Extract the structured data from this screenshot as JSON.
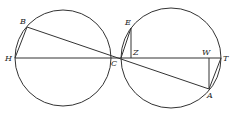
{
  "diagram": {
    "type": "geometric-figure",
    "colors": {
      "stroke": "#333333",
      "background": "#ffffff",
      "label": "#222222"
    },
    "circles": [
      {
        "id": "left-circle",
        "cx": 63,
        "cy": 58,
        "r": 48
      },
      {
        "id": "right-circle",
        "cx": 171,
        "cy": 58,
        "r": 50
      }
    ],
    "points": {
      "B": {
        "label": "B",
        "x": 27,
        "y": 27
      },
      "H": {
        "label": "H",
        "x": 15,
        "y": 58
      },
      "C": {
        "label": "C",
        "x": 121,
        "y": 58
      },
      "E": {
        "label": "E",
        "x": 131,
        "y": 28
      },
      "Z": {
        "label": "Z",
        "x": 131,
        "y": 58
      },
      "W": {
        "label": "W",
        "x": 209,
        "y": 58
      },
      "T": {
        "label": "T",
        "x": 221,
        "y": 58
      },
      "A": {
        "label": "A",
        "x": 209,
        "y": 89
      }
    },
    "segments": [
      [
        "H",
        "T"
      ],
      [
        "B",
        "A"
      ],
      [
        "B",
        "H"
      ],
      [
        "E",
        "C"
      ],
      [
        "E",
        "Z"
      ],
      [
        "W",
        "A"
      ],
      [
        "A",
        "T"
      ]
    ]
  }
}
